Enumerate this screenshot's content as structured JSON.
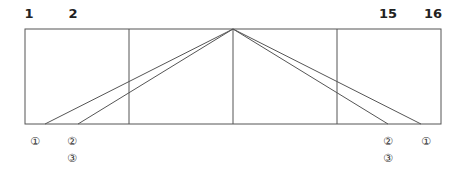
{
  "diagram": {
    "top_labels": [
      {
        "text": "1",
        "x": 29
      },
      {
        "text": "2",
        "x": 73
      },
      {
        "text": "15",
        "x": 388
      },
      {
        "text": "16",
        "x": 433
      }
    ],
    "bottom_labels": [
      {
        "text": "①",
        "x": 35,
        "y": 135
      },
      {
        "text": "②",
        "x": 72,
        "y": 135
      },
      {
        "text": "③",
        "x": 72,
        "y": 152
      },
      {
        "text": "②",
        "x": 388,
        "y": 135
      },
      {
        "text": "③",
        "x": 388,
        "y": 152
      },
      {
        "text": "①",
        "x": 426,
        "y": 135
      }
    ],
    "frame": {
      "x1": 25,
      "y1": 29,
      "x2": 441,
      "y2": 124
    },
    "dividers_x": [
      129,
      233,
      337
    ],
    "apex": {
      "x": 233,
      "y": 29
    },
    "ray_ends_x": [
      45,
      78,
      388,
      421
    ],
    "colors": {
      "line": "#555555",
      "text": "#222222"
    }
  }
}
